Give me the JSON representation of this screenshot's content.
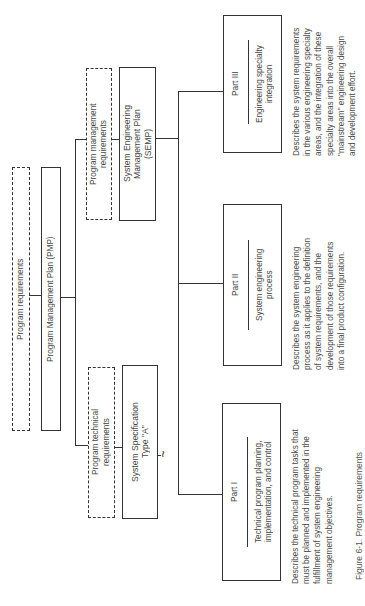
{
  "diagram": {
    "orientation": "rotated 90 degrees counter-clockwise",
    "nodes": {
      "program_requirements": {
        "label": "Program requirements",
        "style": "dashed"
      },
      "pmp": {
        "label": "Program Management Plan (PMP)",
        "style": "solid"
      },
      "program_management_requirements": {
        "label": "Program management\nrequirements",
        "style": "dashed"
      },
      "semp": {
        "label": "System Engineering\nManagement Plan\n(SEMP)",
        "style": "solid"
      },
      "program_technical_requirements": {
        "label": "Program technical\nrequirements",
        "style": "dashed"
      },
      "system_spec": {
        "label": "System Specification\nType \"A\"",
        "style": "solid",
        "connector_symbol": "~"
      },
      "part1": {
        "title": "Part I",
        "subtitle": "Technical program planning,\nimplementation, and control",
        "description": "Describes the technical program tasks that\nmust be planned and implemented in the\nfulfillment of system engineering\nmanagement objectives."
      },
      "part2": {
        "title": "Part II",
        "subtitle": "System engineering\nprocess",
        "description": "Describes the system engineering\nprocess as it applies to the definition\nof system requirements, and the\ndevelopment of those requirements\ninto a final product configuration."
      },
      "part3": {
        "title": "Part III",
        "subtitle": "Engineering specialty\nintegration",
        "description": "Describes the system requirements\nin the various engineering specialty\nareas, and the integration of these\nspecialty areas into the overall\n\"mainstream\" engineering design\nand development effort."
      }
    },
    "edges": [
      [
        "program_requirements",
        "pmp"
      ],
      [
        "pmp",
        "program_management_requirements"
      ],
      [
        "program_management_requirements",
        "semp"
      ],
      [
        "pmp",
        "program_technical_requirements"
      ],
      [
        "program_technical_requirements",
        "system_spec"
      ],
      [
        "semp",
        "part1"
      ],
      [
        "semp",
        "part2"
      ],
      [
        "semp",
        "part3"
      ]
    ],
    "caption": "Figure 6-1. Program requirements"
  }
}
